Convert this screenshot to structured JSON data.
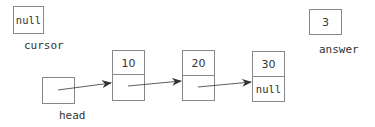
{
  "variables": {
    "cursor": {
      "name": "cursor",
      "value": "null"
    },
    "answer": {
      "name": "answer",
      "value": "3"
    },
    "head": {
      "name": "head",
      "value": ""
    }
  },
  "nodes": [
    {
      "data": "10",
      "next": ""
    },
    {
      "data": "20",
      "next": ""
    },
    {
      "data": "30",
      "next": "null"
    }
  ],
  "colors": {
    "border": "#888888",
    "text": "#333333",
    "arrow": "#333333"
  }
}
